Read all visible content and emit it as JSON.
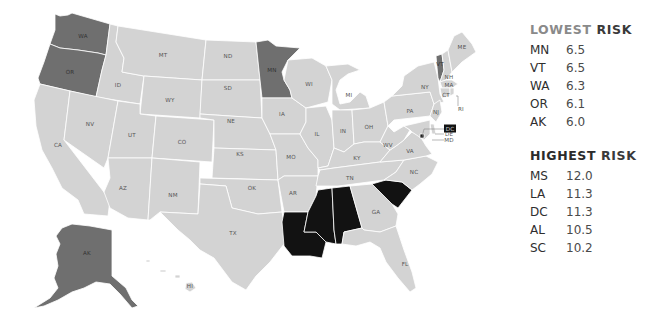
{
  "colors": {
    "base": "#d3d3d3",
    "lowest_risk": "#6f6f6f",
    "highest_risk": "#121212",
    "label": "#555555"
  },
  "map": {
    "states": [
      {
        "code": "WA",
        "category": "lowest"
      },
      {
        "code": "OR",
        "category": "lowest"
      },
      {
        "code": "CA",
        "category": "base"
      },
      {
        "code": "ID",
        "category": "base"
      },
      {
        "code": "NV",
        "category": "base"
      },
      {
        "code": "MT",
        "category": "base"
      },
      {
        "code": "WY",
        "category": "base"
      },
      {
        "code": "UT",
        "category": "base"
      },
      {
        "code": "AZ",
        "category": "base"
      },
      {
        "code": "CO",
        "category": "base"
      },
      {
        "code": "NM",
        "category": "base"
      },
      {
        "code": "ND",
        "category": "base"
      },
      {
        "code": "SD",
        "category": "base"
      },
      {
        "code": "NE",
        "category": "base"
      },
      {
        "code": "KS",
        "category": "base"
      },
      {
        "code": "OK",
        "category": "base"
      },
      {
        "code": "TX",
        "category": "base"
      },
      {
        "code": "MN",
        "category": "lowest"
      },
      {
        "code": "IA",
        "category": "base"
      },
      {
        "code": "MO",
        "category": "base"
      },
      {
        "code": "AR",
        "category": "base"
      },
      {
        "code": "LA",
        "category": "highest"
      },
      {
        "code": "WI",
        "category": "base"
      },
      {
        "code": "IL",
        "category": "base"
      },
      {
        "code": "MI",
        "category": "base"
      },
      {
        "code": "IN",
        "category": "base"
      },
      {
        "code": "OH",
        "category": "base"
      },
      {
        "code": "KY",
        "category": "base"
      },
      {
        "code": "TN",
        "category": "base"
      },
      {
        "code": "MS",
        "category": "highest"
      },
      {
        "code": "AL",
        "category": "highest"
      },
      {
        "code": "GA",
        "category": "base"
      },
      {
        "code": "FL",
        "category": "base"
      },
      {
        "code": "SC",
        "category": "highest"
      },
      {
        "code": "NC",
        "category": "base"
      },
      {
        "code": "VA",
        "category": "base"
      },
      {
        "code": "WV",
        "category": "base"
      },
      {
        "code": "PA",
        "category": "base"
      },
      {
        "code": "NY",
        "category": "base"
      },
      {
        "code": "VT",
        "category": "lowest"
      },
      {
        "code": "NH",
        "category": "base"
      },
      {
        "code": "ME",
        "category": "base"
      },
      {
        "code": "MA",
        "category": "base"
      },
      {
        "code": "CT",
        "category": "base"
      },
      {
        "code": "RI",
        "category": "base"
      },
      {
        "code": "NJ",
        "category": "base"
      },
      {
        "code": "DE",
        "category": "base"
      },
      {
        "code": "MD",
        "category": "base"
      },
      {
        "code": "DC",
        "category": "highest"
      },
      {
        "code": "AK",
        "category": "lowest"
      },
      {
        "code": "HI",
        "category": "base"
      }
    ]
  },
  "legend": {
    "lowest": {
      "title_first": "LOWEST",
      "title_second": "RISK",
      "items": [
        {
          "state": "MN",
          "value": "6.5"
        },
        {
          "state": "VT",
          "value": "6.5"
        },
        {
          "state": "WA",
          "value": "6.3"
        },
        {
          "state": "OR",
          "value": "6.1"
        },
        {
          "state": "AK",
          "value": "6.0"
        }
      ]
    },
    "highest": {
      "title_first": "HIGHEST",
      "title_second": "RISK",
      "items": [
        {
          "state": "MS",
          "value": "12.0"
        },
        {
          "state": "LA",
          "value": "11.3"
        },
        {
          "state": "DC",
          "value": "11.3"
        },
        {
          "state": "AL",
          "value": "10.5"
        },
        {
          "state": "SC",
          "value": "10.2"
        }
      ]
    }
  }
}
